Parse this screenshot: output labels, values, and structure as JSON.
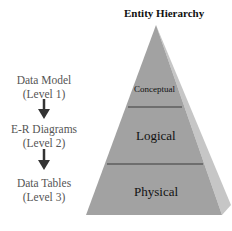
{
  "title": "Entity Hierarchy",
  "levels": [
    {
      "name": "Data Model",
      "level": "(Level 1)"
    },
    {
      "name": "E-R Diagrams",
      "level": "(Level 2)"
    },
    {
      "name": "Data Tables",
      "level": "(Level 3)"
    }
  ],
  "pyramid": {
    "tiers": [
      "Conceptual",
      "Logical",
      "Physical"
    ],
    "colors": {
      "front": "#a3a3a3",
      "side": "#c4c4c4",
      "line": "#3a3a3a"
    }
  }
}
